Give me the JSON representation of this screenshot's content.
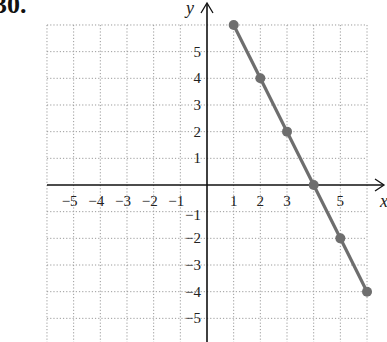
{
  "problem_number": "30.",
  "chart_data": {
    "type": "line",
    "title": "",
    "xlabel": "x",
    "ylabel": "y",
    "xlim": [
      -6,
      6
    ],
    "ylim": [
      -6,
      6
    ],
    "grid": true,
    "x_ticks": [
      -5,
      -4,
      -3,
      -2,
      -1,
      1,
      2,
      3,
      5
    ],
    "y_ticks": [
      -5,
      -4,
      -3,
      -2,
      -1,
      1,
      2,
      3,
      4,
      5
    ],
    "series": [
      {
        "name": "line",
        "color": "#6e6e6e",
        "points": [
          [
            1,
            6
          ],
          [
            2,
            4
          ],
          [
            3,
            2
          ],
          [
            4,
            0
          ],
          [
            5,
            -2
          ],
          [
            6,
            -4
          ]
        ]
      }
    ]
  }
}
